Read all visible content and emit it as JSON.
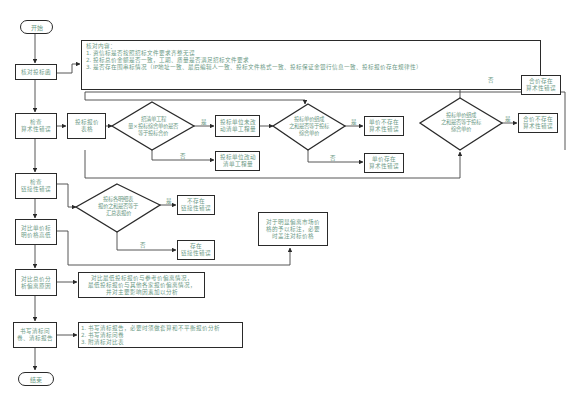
{
  "flowchart": {
    "start": "开始",
    "end": "结束",
    "main_steps": [
      {
        "id": "s1",
        "label": "核对投标函"
      },
      {
        "id": "s2",
        "label": "检查\n算术性错误"
      },
      {
        "id": "s3",
        "label": "检查\n链接性错误"
      },
      {
        "id": "s4",
        "label": "对比单价标\n明价格高低"
      },
      {
        "id": "s5",
        "label": "对比总价分\n析偏离原因"
      },
      {
        "id": "s6",
        "label": "书写清标问\n卷、清标报告"
      }
    ],
    "check_content": {
      "title": "核对内容：",
      "items": [
        "1. 资信标是否按照招标文件要求齐整无误",
        "2. 投标总价金额是否一致，工期、质量是否满足招标文件要求",
        "3. 是否存在围串标情况（IP地址一致、最后编辑人一致、投标文件格式一致、投标保证金银行信息一致、投标报价存在规律性）"
      ]
    },
    "arithmetic": {
      "table_box": "投标报价\n表格",
      "diamond1": "招清单工程\n量×投标综合单价是否\n等于投标合价",
      "yes1_box": "投标单位未改\n动清单工程量",
      "no1_box": "投标单位改动\n清单工程量",
      "diamond2": "投标单价组成\n之和是否等于投标\n综合单价",
      "yes2_box": "单价不存在\n算术性错误",
      "no2_box": "单价存在\n算术性错误",
      "diamond3": "投标单价组成\n之和是否等于投标\n综合单价",
      "yes3_box": "合价不存在\n算术性错误",
      "no3_box": "合价存在\n算术性错误"
    },
    "link": {
      "diamond": "投标各明细表\n报价之和是否等于\n汇总表报价",
      "yes_box": "不存在\n链接性错误",
      "no_box": "存在\n链接性错误"
    },
    "unit_price_note": "对于明显偏离市场价\n格的予以标注，必要\n时盖注对标价格",
    "deviation_note": [
      "对比最低投标报价与参考价偏离情况，",
      "最低投标报价与其他各家报价偏离情况，",
      "并对主要影响因素加以分析"
    ],
    "report_items": [
      "1. 书写清标报告，必要时须做套算和不平衡报价分析",
      "2. 书写清标问卷",
      "3. 附清标对比表"
    ],
    "labels": {
      "yes": "是",
      "no": "否"
    }
  }
}
